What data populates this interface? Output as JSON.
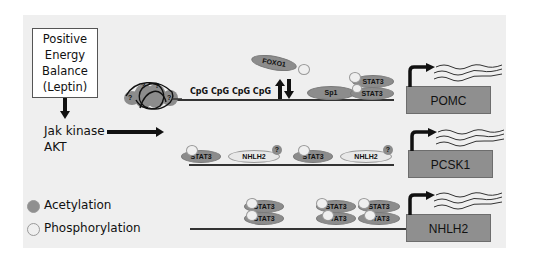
{
  "signal_box": {
    "lines": [
      "Positive",
      "Energy",
      "Balance",
      "(Leptin)"
    ]
  },
  "kinases": {
    "line1": "Jak kinase",
    "line2": "AKT"
  },
  "pomc_row": {
    "cpg_label": "CpG CpG CpG CpG",
    "foxo1": "FOXO1",
    "sp1": "Sp1",
    "stat3_top": "STAT3",
    "stat3_bottom": "STAT3",
    "gene": "POMC",
    "nucleosome_marks": [
      "?",
      "?",
      "?",
      "?"
    ]
  },
  "pcsk1_row": {
    "stat3_a": "STAT3",
    "nhlh2_a": "NHLH2",
    "q_a": "?",
    "stat3_b": "STAT3",
    "nhlh2_b": "NHLH2",
    "q_b": "?",
    "gene": "PCSK1"
  },
  "nhlh2_row": {
    "stat3_labels": [
      "STAT3",
      "STAT3",
      "STAT3",
      "STAT3",
      "STAT3",
      "STAT3"
    ],
    "gene": "NHLH2"
  },
  "legend": {
    "acetylation": "Acetylation",
    "phosphorylation": "Phosphorylation"
  },
  "colors": {
    "panel": "#efefef",
    "gene_box": "#8f8f8f",
    "acetylation": "#8c8c8c",
    "phosphorylation": "#e8e8e8"
  }
}
